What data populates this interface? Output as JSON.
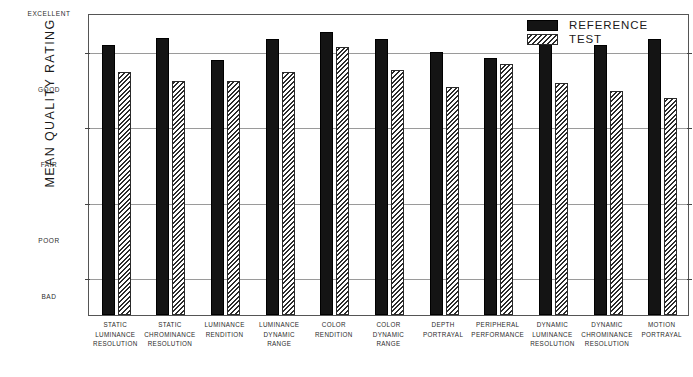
{
  "chart_data": {
    "type": "bar",
    "title": "",
    "subtitle": "",
    "xlabel": "",
    "ylabel": "MEAN QUALITY RATING",
    "ylim": [
      1,
      5
    ],
    "grid": true,
    "grid_axis": "y",
    "legend_position": "top-right",
    "ytick_labels": [
      "EXCELLENT",
      "GOOD",
      "FAIR",
      "POOR",
      "BAD"
    ],
    "ytick_values": [
      5,
      4,
      3,
      2,
      1
    ],
    "categories": [
      "STATIC LUMINANCE RESOLUTION",
      "STATIC CHROMINANCE RESOLUTION",
      "LUMINANCE RENDITION",
      "LUMINANCE DYNAMIC RANGE",
      "COLOR RENDITION",
      "COLOR DYNAMIC RANGE",
      "DEPTH PORTRAYAL",
      "PERIPHERAL PERFORMANCE",
      "DYNAMIC LUMINANCE RESOLUTION",
      "DYNAMIC CHROMINANCE RESOLUTION",
      "MOTION PORTRAYAL"
    ],
    "category_lines": [
      [
        "STATIC",
        "LUMINANCE",
        "RESOLUTION"
      ],
      [
        "STATIC",
        "CHROMINANCE",
        "RESOLUTION"
      ],
      [
        "LUMINANCE",
        "RENDITION"
      ],
      [
        "LUMINANCE",
        "DYNAMIC",
        "RANGE"
      ],
      [
        "COLOR",
        "RENDITION"
      ],
      [
        "COLOR",
        "DYNAMIC",
        "RANGE"
      ],
      [
        "DEPTH",
        "PORTRAYAL"
      ],
      [
        "PERIPHERAL",
        "PERFORMANCE"
      ],
      [
        "DYNAMIC",
        "LUMINANCE",
        "RESOLUTION"
      ],
      [
        "DYNAMIC",
        "CHROMINANCE",
        "RESOLUTION"
      ],
      [
        "MOTION",
        "PORTRAYAL"
      ]
    ],
    "series": [
      {
        "name": "REFERENCE",
        "style": "solid-black",
        "color": "#141414",
        "values": [
          4.57,
          4.67,
          4.38,
          4.65,
          4.75,
          4.65,
          4.48,
          4.41,
          4.7,
          4.58,
          4.66
        ]
      },
      {
        "name": "TEST",
        "style": "diagonal-hatch",
        "color": "#ffffff",
        "values": [
          4.22,
          4.1,
          4.1,
          4.22,
          4.55,
          4.25,
          4.02,
          4.33,
          4.07,
          3.97,
          3.88
        ]
      }
    ]
  },
  "legend": {
    "items": [
      {
        "label": "REFERENCE",
        "swatch": "solid-black"
      },
      {
        "label": "TEST",
        "swatch": "diagonal-hatch"
      }
    ]
  }
}
